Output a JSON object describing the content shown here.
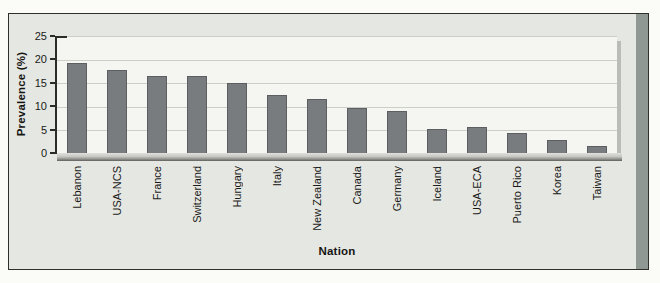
{
  "figure": {
    "page_background": "#fbfbf8",
    "panel_background": "#e5e7e2",
    "panel_border_color": "#2f2f2c",
    "plot_background": "#f5f6f2",
    "bar_color": "#797c7e",
    "gridline_color": "#cbcfc8",
    "axis_color": "#2b2b28",
    "accent_band_color": "#8f9893"
  },
  "chart_data": {
    "type": "bar",
    "title": "",
    "xlabel": "Nation",
    "ylabel": "Prevalence (%)",
    "categories": [
      "Lebanon",
      "USA-NCS",
      "France",
      "Switzerland",
      "Hungary",
      "Italy",
      "New Zealand",
      "Canada",
      "Germany",
      "Iceland",
      "USA-ECA",
      "Puerto Rico",
      "Korea",
      "Taiwan"
    ],
    "values": [
      19.3,
      17.9,
      16.7,
      16.7,
      15.1,
      12.5,
      11.6,
      9.6,
      9.0,
      5.2,
      5.5,
      4.3,
      2.9,
      1.6
    ],
    "ylim": [
      0,
      25
    ],
    "yticks": [
      0,
      5,
      10,
      15,
      20,
      25
    ],
    "grid": true,
    "legend_position": "none"
  }
}
